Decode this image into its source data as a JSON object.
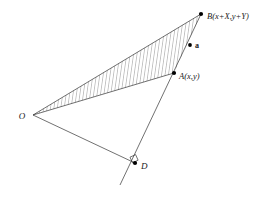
{
  "figure": {
    "background_color": "#ffffff",
    "stroke_color": "#333333",
    "hatch_color": "#555555",
    "point_color": "#000000",
    "labels": {
      "origin": "O",
      "point_a": "A(x,y)",
      "point_b": "B(x+X,y+Y)",
      "vector_a": "a",
      "point_d": "D"
    },
    "points": {
      "O": {
        "x": 33,
        "y": 115
      },
      "A": {
        "x": 174,
        "y": 73
      },
      "B": {
        "x": 201,
        "y": 14
      },
      "D": {
        "x": 135,
        "y": 163
      },
      "line_end": {
        "x": 120,
        "y": 185
      }
    },
    "hatch": {
      "count": 40,
      "angle_label": "near-vertical",
      "line_width": 0.5
    },
    "right_angle_marker": {
      "present": true,
      "at": "D",
      "size": 6
    }
  }
}
